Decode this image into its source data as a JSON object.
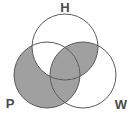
{
  "diagram": {
    "type": "venn",
    "set_count": 3,
    "background_color": "#ffffff",
    "stroke_color": "#5a5a5a",
    "shade_color": "#a0a0a0",
    "unshaded_color": "#ffffff",
    "sets": [
      {
        "id": "H",
        "label": "H",
        "label_x": 65,
        "label_y": 9,
        "cx": 65,
        "cy": 47,
        "r": 33
      },
      {
        "id": "P",
        "label": "P",
        "label_x": 10,
        "label_y": 105,
        "cx": 47,
        "cy": 75,
        "r": 33
      },
      {
        "id": "W",
        "label": "W",
        "label_x": 121,
        "label_y": 106,
        "cx": 83,
        "cy": 75,
        "r": 33
      }
    ],
    "regions": [
      {
        "id": "H-only",
        "sets": [
          "H"
        ],
        "shaded": false
      },
      {
        "id": "P-only",
        "sets": [
          "P"
        ],
        "shaded": true
      },
      {
        "id": "W-only",
        "sets": [
          "W"
        ],
        "shaded": false
      },
      {
        "id": "H-and-P",
        "sets": [
          "H",
          "P"
        ],
        "shaded": false
      },
      {
        "id": "H-and-W",
        "sets": [
          "H",
          "W"
        ],
        "shaded": true
      },
      {
        "id": "P-and-W",
        "sets": [
          "P",
          "W"
        ],
        "shaded": true
      },
      {
        "id": "H-P-and-W",
        "sets": [
          "H",
          "P",
          "W"
        ],
        "shaded": true
      }
    ]
  }
}
